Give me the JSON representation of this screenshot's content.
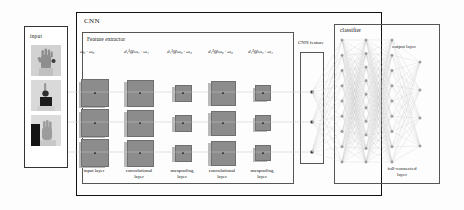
{
  "figure": {
    "type": "architecture-diagram"
  },
  "input_panel": {
    "title": "input",
    "thumbnails": [
      {
        "name": "hand-gesture-open-palm",
        "alt": "open palm hand gesture"
      },
      {
        "name": "hand-gesture-pointing",
        "alt": "pointing hand gesture"
      },
      {
        "name": "hand-gesture-side",
        "alt": "side hand gesture"
      }
    ]
  },
  "cnn": {
    "title": "CNN",
    "feature_extractor": {
      "title": "Feature extractor",
      "weight_labels": [
        {
          "d": "",
          "dsup": "",
          "dsub": "",
          "at": "",
          "w1": "ω",
          "w1sub": "0",
          "w2": "ω",
          "w2sub": "0",
          "text": "ω₀ · ω₀"
        },
        {
          "text": "d₁¹@ω₁ · ω₁"
        },
        {
          "text": "d₁¹@ω₂ · ω₂"
        },
        {
          "text": "d₁²@ω₃ · ω₃"
        },
        {
          "text": "d₁²@ω₄ · ω₄"
        }
      ],
      "stage_labels": [
        "input layer",
        "convolutional\nlayer",
        "maxpooling\nlayer",
        "convolutional\nlayer",
        "maxpooling\nlayer"
      ],
      "columns": [
        {
          "index": 0,
          "stage": "input layer",
          "size_px": 26,
          "rows": 3
        },
        {
          "index": 1,
          "stage": "convolutional layer",
          "size_px": 25,
          "rows": 3
        },
        {
          "index": 2,
          "stage": "maxpooling layer",
          "size_px": 15,
          "rows": 3
        },
        {
          "index": 3,
          "stage": "convolutional layer",
          "size_px": 23,
          "rows": 3
        },
        {
          "index": 4,
          "stage": "maxpooling layer",
          "size_px": 14,
          "rows": 3
        }
      ]
    },
    "cnn_feature": {
      "title": "CNN feature",
      "node_count": 3
    }
  },
  "classifier": {
    "title": "classifier",
    "output_layer_label": "output layer",
    "full_connected_label": "full-connected\nlayer",
    "layers": [
      {
        "name": "fc-layer-1",
        "nodes": 9
      },
      {
        "name": "fc-layer-2",
        "nodes": 10
      },
      {
        "name": "fc-layer-3",
        "nodes": 9
      },
      {
        "name": "output-layer",
        "nodes": 4
      }
    ]
  },
  "colors": {
    "feature_map_fill": "#8c8c8c",
    "feature_map_shadow": "#b9b9b9",
    "frame": "#111111",
    "thin_frame": "#555555",
    "wire": "#b0b0b0",
    "node": "#333333",
    "background": "#fdfdfd"
  }
}
